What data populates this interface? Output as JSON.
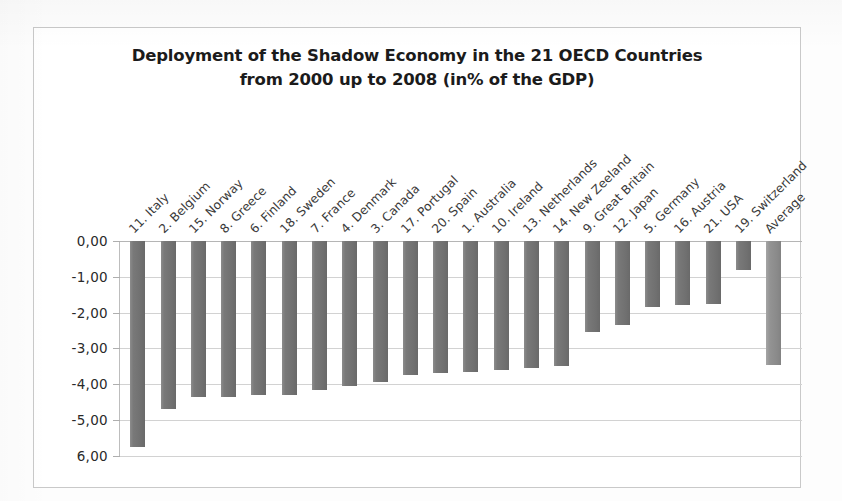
{
  "chart_data": {
    "type": "bar",
    "title": "Deployment of the Shadow Economy in the 21 OECD Countries",
    "subtitle": "from 2000 up to 2008  (in% of the GDP)",
    "title_line1": "Deployment of the Shadow Economy in the 21 OECD Countries",
    "title_line2": "from 2000 up to 2008  (in% of the GDP)",
    "xlabel": "",
    "ylabel": "",
    "ylim": [
      -6.0,
      0.0
    ],
    "grid": true,
    "legend": "none",
    "orientation": "vertical",
    "tick_labels": [
      "0,00",
      "-1,00",
      "-2,00",
      "-3,00",
      "-4,00",
      "-5,00",
      "6,00"
    ],
    "tick_values": [
      0,
      -1,
      -2,
      -3,
      -4,
      -5,
      -6
    ],
    "categories": [
      "11. Italy",
      "2. Belgium",
      "15. Norway",
      "8. Greece",
      "6. Finland",
      "18. Sweden",
      "7. France",
      "4. Denmark",
      "3. Canada",
      "17. Portugal",
      "20. Spain",
      "1. Australia",
      "10. Ireland",
      "13. Netherlands",
      "14. New Zeeland",
      "9. Great Britain",
      "12. Japan",
      "5. Germany",
      "16. Austria",
      "21. USA",
      "19. Switzerland",
      "Average"
    ],
    "values": [
      -5.75,
      -4.7,
      -4.35,
      -4.35,
      -4.3,
      -4.3,
      -4.15,
      -4.05,
      -3.95,
      -3.75,
      -3.7,
      -3.65,
      -3.6,
      -3.55,
      -3.5,
      -2.55,
      -2.35,
      -1.85,
      -1.8,
      -1.75,
      -0.8,
      -3.45
    ],
    "series_name": "Change in shadow economy 2000-2008",
    "highlight_category": "Average",
    "colors": {
      "bar": "#767676",
      "average_bar": "#8f8f8f",
      "gridline": "#d2d2d2",
      "axis": "#bdbdbd",
      "frame": "#c9c9c9",
      "text": "#2a2a2a",
      "title_text": "#1b1b1b",
      "background": "#ffffff"
    }
  }
}
